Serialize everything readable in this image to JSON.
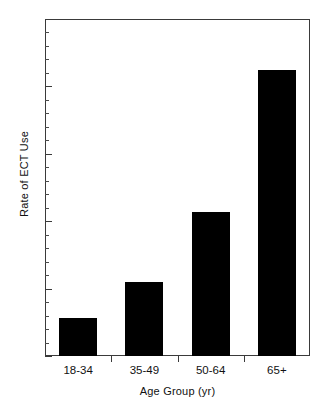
{
  "chart_data": {
    "type": "bar",
    "title": "",
    "xlabel": "Age Group (yr)",
    "ylabel": "Rate of ECT Use",
    "categories": [
      "18-34",
      "35-49",
      "50-64",
      "65+"
    ],
    "values": [
      2.8,
      5.5,
      10.7,
      21.2
    ],
    "ylim": [
      0,
      25
    ],
    "ytick_labels": [
      "0",
      "5",
      "10",
      "15",
      "20",
      "25"
    ],
    "ytick_values": [
      0,
      5,
      10,
      15,
      20,
      25
    ],
    "yminor_step": 1,
    "grid": false,
    "legend": "none",
    "bar_color": "#000000",
    "axis_color": "#3a3a3a",
    "background": "#ffffff"
  }
}
